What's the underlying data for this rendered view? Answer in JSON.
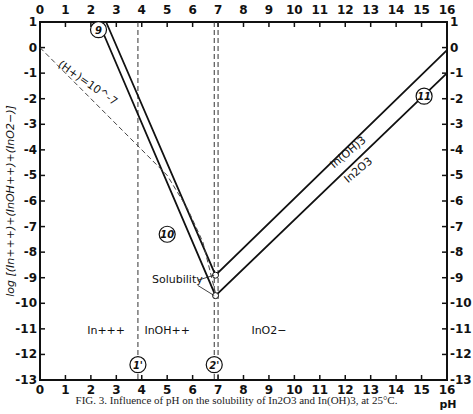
{
  "chart_data": {
    "type": "line",
    "title": "",
    "caption": "FIG. 3. Influence of pH on the solubility of In2O3 and In(OH)3, at 25°C.",
    "xlabel": "pH",
    "ylabel": "log [(In+++)+(InOH++)+(InO2−)]",
    "xlim": [
      0,
      16
    ],
    "ylim": [
      -13,
      1
    ],
    "x_ticks": [
      0,
      1,
      2,
      3,
      4,
      5,
      6,
      7,
      8,
      9,
      10,
      11,
      12,
      13,
      14,
      15,
      16
    ],
    "y_ticks": [
      1,
      0,
      -1,
      -2,
      -3,
      -4,
      -5,
      -6,
      -7,
      -8,
      -9,
      -10,
      -11,
      -12,
      -13
    ],
    "grid": false,
    "series": [
      {
        "name": "In(OH)3",
        "style": "solid",
        "points": [
          [
            2.6,
            1
          ],
          [
            6.9,
            -8.9
          ],
          [
            16,
            -0.1
          ]
        ]
      },
      {
        "name": "In2O3",
        "style": "solid",
        "points": [
          [
            2.3,
            1
          ],
          [
            6.9,
            -9.7
          ],
          [
            16,
            -1.0
          ]
        ]
      },
      {
        "name": "(H+)=10^-7",
        "style": "dashed",
        "points": [
          [
            0,
            0
          ],
          [
            3.8,
            -3.8
          ],
          [
            5.0,
            -5.0
          ],
          [
            5.8,
            -6.3
          ],
          [
            6.4,
            -7.6
          ],
          [
            6.9,
            -9.6
          ]
        ]
      }
    ],
    "vertical_lines": [
      {
        "x": 3.85,
        "style": "dashed",
        "label": "1'"
      },
      {
        "x": 6.85,
        "style": "dashed",
        "label": "2'"
      },
      {
        "x": 7.0,
        "style": "dashed",
        "label": ""
      }
    ],
    "circled_labels": [
      {
        "text": "9",
        "x": 2.3,
        "y": 0.7
      },
      {
        "text": "10",
        "x": 5.0,
        "y": -7.3
      },
      {
        "text": "11",
        "x": 15.1,
        "y": -1.9
      },
      {
        "text": "1'",
        "x": 3.85,
        "y": -12.4
      },
      {
        "text": "2'",
        "x": 6.85,
        "y": -12.4
      }
    ],
    "annotations": [
      {
        "text": "(H+)=10^-7",
        "x": 1.8,
        "y": -1.5,
        "rotation": 35
      },
      {
        "text": "Solubility",
        "x": 5.4,
        "y": -9.2
      },
      {
        "text": "In(OH)3",
        "x": 12.2,
        "y": -4.2,
        "rotation": -40
      },
      {
        "text": "In2O3",
        "x": 12.6,
        "y": -4.9,
        "rotation": -40
      },
      {
        "text": "In+++",
        "x": 2.6,
        "y": -11.2
      },
      {
        "text": "InOH++",
        "x": 5.0,
        "y": -11.2
      },
      {
        "text": "InO2−",
        "x": 9.0,
        "y": -11.2
      }
    ]
  }
}
